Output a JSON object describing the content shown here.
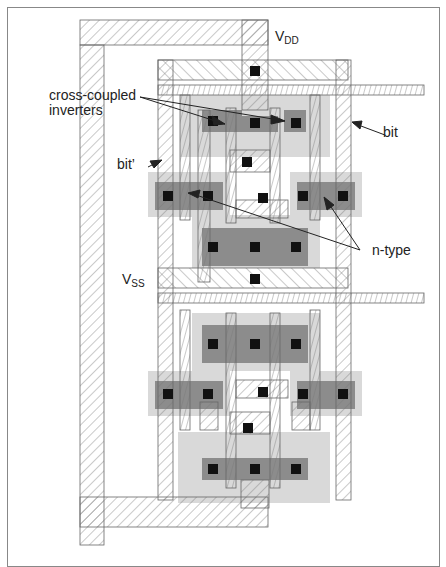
{
  "diagram": {
    "labels": {
      "vdd_main": "V",
      "vdd_sub": "DD",
      "vss_main": "V",
      "vss_sub": "SS",
      "cross_coupled_line1": "cross-coupled",
      "cross_coupled_line2": "inverters",
      "bit": "bit",
      "bit_bar": "bit’",
      "n_type": "n-type"
    },
    "layers": {
      "metal_hatch": "hatched outline (metal / poly)",
      "diffusion_light": "#d9d9d9",
      "diffusion_dark": "#8c8c8c",
      "contact": "#111111"
    },
    "colors": {
      "frame": "#888888",
      "stroke": "#555555",
      "text": "#222222"
    }
  }
}
